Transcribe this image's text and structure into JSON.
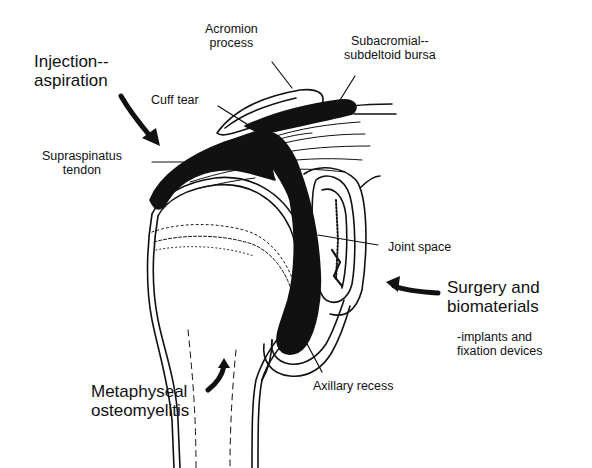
{
  "diagram": {
    "colors": {
      "ink": "#111111",
      "background": "#ffffff"
    },
    "labels": {
      "injection": {
        "line1": "Injection--",
        "line2": "aspiration"
      },
      "acromion": {
        "line1": "Acromion",
        "line2": "process"
      },
      "bursa": {
        "line1": "Subacromial--",
        "line2": "subdeltoid bursa"
      },
      "cuff_tear": {
        "line1": "Cuff tear"
      },
      "supraspinatus": {
        "line1": "Supraspinatus",
        "line2": "tendon"
      },
      "joint_space": {
        "line1": "Joint space"
      },
      "surgery": {
        "line1": "Surgery and",
        "line2": "biomaterials",
        "line3": "-implants and",
        "line4": "fixation devices"
      },
      "axillary": {
        "line1": "Axillary recess"
      },
      "metaphyseal": {
        "line1": "Metaphyseal",
        "line2": "osteomyelitis"
      }
    },
    "arrows": [
      {
        "name": "injection-arrow",
        "points_to": "subacromial space"
      },
      {
        "name": "surgery-arrow",
        "points_to": "glenoid"
      },
      {
        "name": "osteomyelitis-arrow",
        "points_to": "humeral metaphysis"
      }
    ]
  }
}
